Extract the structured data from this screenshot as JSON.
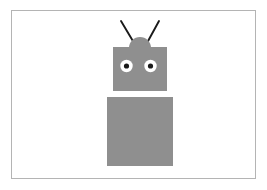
{
  "canvas": {
    "width": 267,
    "height": 190,
    "background_color": "#ffffff",
    "title": "Robot Figure"
  },
  "frame": {
    "name": "image-border",
    "x": 11,
    "y": 10,
    "width": 244,
    "height": 168,
    "stroke_color": "#b4b4b4",
    "stroke_width": 1,
    "fill": "none"
  },
  "figure": {
    "name": "robot",
    "body_fill_color": "#8f8f8f",
    "eye_white_color": "#ffffff",
    "pupil_color": "#1a1a1a",
    "antenna_color": "#1a1a1a",
    "parts": {
      "head": {
        "label": "head",
        "x": 113,
        "y": 47,
        "width": 54,
        "height": 44
      },
      "head_hump": {
        "label": "head-hump",
        "cx": 140,
        "cy": 48,
        "r": 11
      },
      "torso": {
        "label": "torso",
        "x": 107,
        "y": 97,
        "width": 66,
        "height": 69
      },
      "left_eye": {
        "label": "left-eye",
        "cx": 126.5,
        "cy": 66,
        "r": 6.2,
        "pupil_r": 2.6
      },
      "right_eye": {
        "label": "right-eye",
        "cx": 150.5,
        "cy": 66,
        "r": 6.2,
        "pupil_r": 2.6
      },
      "left_antenna": {
        "label": "left-antenna",
        "x1": 121,
        "y1": 21,
        "x2": 133.5,
        "y2": 42,
        "stroke_width": 1.9
      },
      "right_antenna": {
        "label": "right-antenna",
        "x1": 159,
        "y1": 21,
        "x2": 147.5,
        "y2": 42,
        "stroke_width": 1.9
      }
    }
  }
}
